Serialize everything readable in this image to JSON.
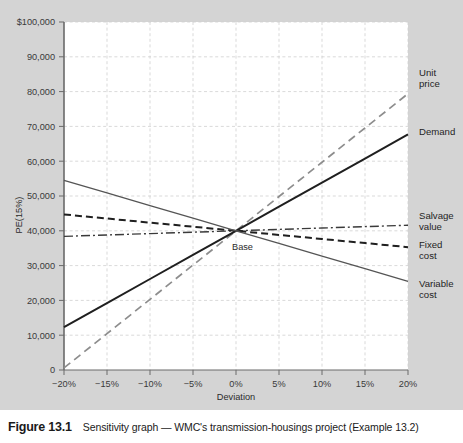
{
  "figure": {
    "number": "Figure 13.1",
    "caption": "Sensitivity graph — WMC's transmission-housings project (Example 13.2)"
  },
  "annotations": {
    "base_point_label": "Base"
  },
  "colors": {
    "page_background": "#d4d4d4",
    "plot_background": "#ffffff",
    "axis": "#555555",
    "grid": "#cfcfcf",
    "line_dark": "#1f1f1f",
    "line_mid": "#555555",
    "line_light": "#9a9a9a",
    "caption_background": "#ffffff",
    "caption_text": "#1a1a1a"
  },
  "chart_data": {
    "type": "line",
    "title": "Sensitivity graph — WMC's transmission-housings project",
    "xlabel": "Deviation",
    "ylabel": "PE(15%)",
    "grid": true,
    "legend_position": "right-of-plot",
    "xlim": [
      -20,
      20
    ],
    "ylim": [
      0,
      100000
    ],
    "x": [
      -20,
      -15,
      -10,
      -5,
      0,
      5,
      10,
      15,
      20
    ],
    "xtick_labels": [
      "−20%",
      "−15%",
      "−10%",
      "−5%",
      "0%",
      "5%",
      "10%",
      "15%",
      "20%"
    ],
    "ytick_values": [
      0,
      10000,
      20000,
      30000,
      40000,
      50000,
      60000,
      70000,
      80000,
      90000,
      100000
    ],
    "ytick_labels": [
      "0",
      "10,000",
      "20,000",
      "30,000",
      "40,000",
      "50,000",
      "60,000",
      "70,000",
      "80,000",
      "90,000",
      "$100,000"
    ],
    "base_point": {
      "x": 0,
      "y": 40000
    },
    "series": [
      {
        "name": "Unit price",
        "label": "Unit\nprice",
        "label_line1": "Unit",
        "label_line2": "price",
        "style": "long-dash",
        "color": "#8d8d8d",
        "values": [
          600,
          10450,
          20300,
          30150,
          40000,
          49850,
          59700,
          69550,
          79400
        ]
      },
      {
        "name": "Demand",
        "label": "Demand",
        "label_line1": "Demand",
        "label_line2": "",
        "style": "solid-thick",
        "color": "#1f1f1f",
        "values": [
          12300,
          19225,
          26150,
          33075,
          40000,
          46925,
          53850,
          60775,
          67700
        ]
      },
      {
        "name": "Salvage value",
        "label": "Salvage\nvalue",
        "label_line1": "Salvage",
        "label_line2": "value",
        "style": "dash-dot",
        "color": "#3a3a3a",
        "values": [
          38400,
          38800,
          39200,
          39600,
          40000,
          40400,
          40800,
          41200,
          41600
        ]
      },
      {
        "name": "Fixed cost",
        "label": "Fixed\ncost",
        "label_line1": "Fixed",
        "label_line2": "cost",
        "style": "dash",
        "color": "#1f1f1f",
        "values": [
          44700,
          43525,
          42350,
          41175,
          40000,
          38825,
          37650,
          36475,
          35300
        ]
      },
      {
        "name": "Variable cost",
        "label": "Variable\ncost",
        "label_line1": "Variable",
        "label_line2": "cost",
        "style": "solid-thin",
        "color": "#555555",
        "values": [
          54500,
          50875,
          47250,
          43625,
          40000,
          36375,
          32750,
          29125,
          25500
        ]
      }
    ]
  }
}
